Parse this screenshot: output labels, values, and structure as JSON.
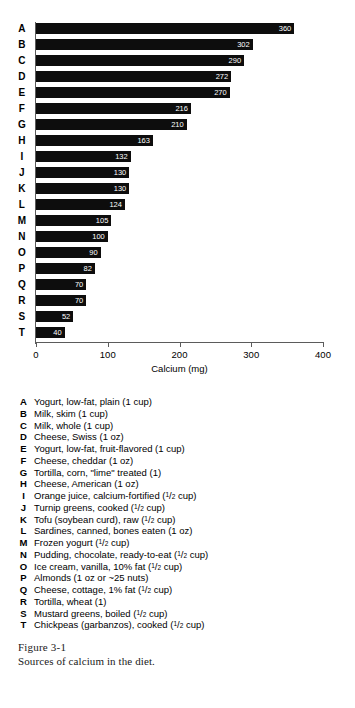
{
  "figure": {
    "caption_title": "Figure 3-1",
    "caption_description": "Sources of calcium in the diet."
  },
  "chart_data": {
    "type": "bar",
    "orientation": "horizontal",
    "title": "",
    "xlabel": "Calcium (mg)",
    "ylabel": "",
    "xlim": [
      0,
      400
    ],
    "xticks": [
      0,
      100,
      200,
      300,
      400
    ],
    "grid": false,
    "legend_position": "below-axis",
    "categories": [
      "A",
      "B",
      "C",
      "D",
      "E",
      "F",
      "G",
      "H",
      "I",
      "J",
      "K",
      "L",
      "M",
      "N",
      "O",
      "P",
      "Q",
      "R",
      "S",
      "T"
    ],
    "values": [
      360,
      302,
      290,
      272,
      270,
      216,
      210,
      163,
      132,
      130,
      130,
      124,
      105,
      100,
      90,
      82,
      70,
      70,
      52,
      40
    ],
    "bar_color": "#0d0d0d",
    "value_label_color": "#ffffff"
  },
  "legend": {
    "items": [
      {
        "key": "A",
        "label": "Yogurt, low-fat, plain (1 cup)"
      },
      {
        "key": "B",
        "label": "Milk, skim (1 cup)"
      },
      {
        "key": "C",
        "label": "Milk, whole (1 cup)"
      },
      {
        "key": "D",
        "label": "Cheese, Swiss (1 oz)"
      },
      {
        "key": "E",
        "label": "Yogurt, low-fat, fruit-flavored (1 cup)"
      },
      {
        "key": "F",
        "label": "Cheese, cheddar (1 oz)"
      },
      {
        "key": "G",
        "label": "Tortilla, corn, \"lime\" treated (1)"
      },
      {
        "key": "H",
        "label": "Cheese, American (1 oz)"
      },
      {
        "key": "I",
        "label": "Orange juice, calcium-fortified (1/2 cup)"
      },
      {
        "key": "J",
        "label": "Turnip greens, cooked (1/2 cup)"
      },
      {
        "key": "K",
        "label": "Tofu (soybean curd), raw (1/2 cup)"
      },
      {
        "key": "L",
        "label": "Sardines, canned, bones eaten (1 oz)"
      },
      {
        "key": "M",
        "label": "Frozen yogurt (1/2 cup)"
      },
      {
        "key": "N",
        "label": "Pudding, chocolate, ready-to-eat (1/2 cup)"
      },
      {
        "key": "O",
        "label": "Ice cream, vanilla, 10% fat (1/2 cup)"
      },
      {
        "key": "P",
        "label": "Almonds (1 oz or ~25 nuts)"
      },
      {
        "key": "Q",
        "label": "Cheese, cottage, 1% fat (1/2 cup)"
      },
      {
        "key": "R",
        "label": "Tortilla, wheat (1)"
      },
      {
        "key": "S",
        "label": "Mustard greens, boiled (1/2 cup)"
      },
      {
        "key": "T",
        "label": "Chickpeas (garbanzos), cooked (1/2 cup)"
      }
    ]
  }
}
